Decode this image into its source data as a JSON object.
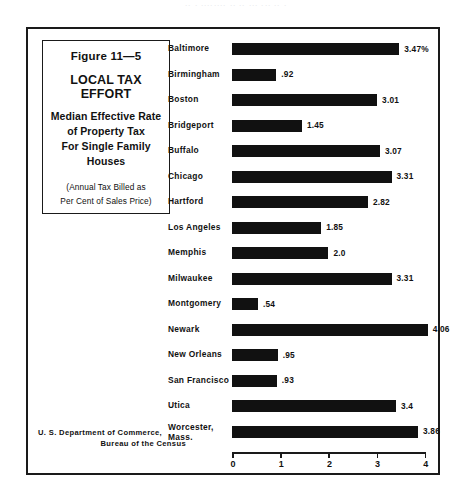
{
  "artifact": {
    "bleed_text": "․․ ․ ․․․․․․․․ ․․ ․․ ․․․ ․․․ ․․ ․"
  },
  "caption": {
    "figure_number": "Figure 11—5",
    "heading": "LOCAL TAX EFFORT",
    "subtitle_lines": [
      "Median Effective Rate",
      "of Property Tax",
      "For Single Family",
      "Houses"
    ],
    "paren_lines": [
      "(Annual Tax Billed as",
      "Per Cent of Sales Price)"
    ]
  },
  "source": {
    "lines": [
      "U. S. Department of Commerce,",
      "Bureau of the Census"
    ]
  },
  "chart_data": {
    "type": "bar",
    "orientation": "horizontal",
    "title": "LOCAL TAX EFFORT",
    "subtitle": "Median Effective Rate of Property Tax For Single Family Houses",
    "note": "(Annual Tax Billed as Per Cent of Sales Price)",
    "figure_number": "Figure 11—5",
    "source": "U. S. Department of Commerce, Bureau of the Census",
    "xlabel": "",
    "ylabel": "",
    "xlim": [
      0,
      4
    ],
    "xticks": [
      0,
      1,
      2,
      3,
      4
    ],
    "xtick_labels": [
      "0",
      "1",
      "2",
      "3",
      "4"
    ],
    "grid": false,
    "legend": "none",
    "units": "per cent",
    "categories": [
      "Baltimore",
      "Birmingham",
      "Boston",
      "Bridgeport",
      "Buffalo",
      "Chicago",
      "Hartford",
      "Los Angeles",
      "Memphis",
      "Milwaukee",
      "Montgomery",
      "Newark",
      "New Orleans",
      "San Francisco",
      "Utica",
      "Worcester, Mass."
    ],
    "values": [
      3.47,
      0.92,
      3.01,
      1.45,
      3.07,
      3.31,
      2.82,
      1.85,
      2.0,
      3.31,
      0.54,
      4.06,
      0.95,
      0.93,
      3.4,
      3.86
    ],
    "value_labels": [
      "3.47%",
      ".92",
      "3.01",
      "1.45",
      "3.07",
      "3.31",
      "2.82",
      "1.85",
      "2.0",
      "3.31",
      ".54",
      "4.06",
      ".95",
      ".93",
      "3.4",
      "3.86"
    ],
    "category_labels": [
      "Baltimore",
      "Birmingham",
      "Boston",
      "Bridgeport",
      "Buffalo",
      "Chicago",
      "Hartford",
      "Los Angeles",
      "Memphis",
      "Milwaukee",
      "Montgomery",
      "Newark",
      "New Orleans",
      "San Francisco",
      "Utica",
      "Worcester,\nMass."
    ],
    "bar_color": "#111111"
  }
}
